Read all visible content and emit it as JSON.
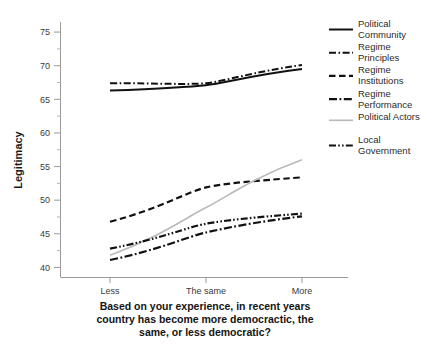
{
  "chart_data": {
    "type": "line",
    "title": "",
    "xlabel": "Based on your experience, in recent years country has become more democractic, the same, or less democratic?",
    "xlabel_lines": [
      "Based on your experience, in recent years",
      "country has become more democractic, the",
      "same, or less democratic?"
    ],
    "ylabel": "Legitimacy",
    "categories": [
      "Less",
      "The same",
      "More"
    ],
    "x": [
      0,
      1,
      2
    ],
    "ylim": [
      38.5,
      76.5
    ],
    "yticks": [
      40,
      45,
      50,
      55,
      60,
      65,
      70,
      75
    ],
    "ytick_labels": [
      "40",
      "45",
      "50",
      "55",
      "60",
      "65",
      "70",
      "75"
    ],
    "yticks_minor": [
      42.5,
      47.5,
      52.5,
      57.5,
      62.5,
      67.5,
      72.5
    ],
    "grid": false,
    "legend_position": "right",
    "series": [
      {
        "name": "Political Community",
        "values": [
          66.3,
          67.1,
          69.5
        ],
        "style": "solid",
        "color": "#111111",
        "width": 2.0,
        "dash": "none"
      },
      {
        "name": "Regime Principles",
        "values": [
          67.4,
          67.4,
          70.1
        ],
        "style": "dash-dot",
        "color": "#111111",
        "width": 2.0,
        "dash": "7,2.5,1.6,2.5"
      },
      {
        "name": "Regime Institutions",
        "values": [
          46.8,
          51.9,
          53.4
        ],
        "style": "dashed",
        "color": "#111111",
        "width": 2.2,
        "dash": "6.5,3.5"
      },
      {
        "name": "Regime Performance",
        "values": [
          41.1,
          45.2,
          47.6
        ],
        "style": "dash-dot",
        "color": "#111111",
        "width": 2.2,
        "dash": "8,2.5,1.8,2.5"
      },
      {
        "name": "Political Actors",
        "values": [
          41.8,
          48.9,
          56.0
        ],
        "style": "solid-light",
        "color": "#b9b9b9",
        "width": 1.6,
        "dash": "none"
      },
      {
        "name": "Local Government",
        "values": [
          42.8,
          46.5,
          48.0
        ],
        "style": "dash-dot-dot",
        "color": "#111111",
        "width": 2.2,
        "dash": "7,2.2,1.6,2.2,1.6,2.2"
      }
    ]
  },
  "legend": {
    "items": [
      {
        "label_line1": "Political",
        "label_line2": "Community"
      },
      {
        "label_line1": "Regime",
        "label_line2": "Principles"
      },
      {
        "label_line1": "Regime",
        "label_line2": "Institutions"
      },
      {
        "label_line1": "Regime",
        "label_line2": "Performance"
      },
      {
        "label_line1": "Political Actors",
        "label_line2": ""
      },
      {
        "label_line1": "Local",
        "label_line2": "Government"
      }
    ]
  },
  "axes": {
    "y_tick_0": "40",
    "y_tick_1": "45",
    "y_tick_2": "50",
    "y_tick_3": "55",
    "y_tick_4": "60",
    "y_tick_5": "65",
    "y_tick_6": "70",
    "y_tick_7": "75",
    "x_tick_0": "Less",
    "x_tick_1": "The same",
    "x_tick_2": "More"
  }
}
